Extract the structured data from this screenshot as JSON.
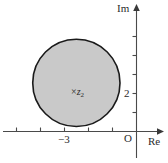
{
  "figure": {
    "kind": "complex-plane-disk-diagram",
    "background_color": "#ffffff"
  },
  "axes": {
    "imaginary_label": "Im",
    "real_label": "Re",
    "origin_label": "O",
    "axis_color": "#4a4a4a"
  },
  "tick_labels": {
    "real": "−3",
    "imaginary": "2"
  },
  "region": {
    "center_label_marker": "×",
    "center_label_symbol": "z",
    "center_label_subscript": "2",
    "fill_color": "#c9c9c9",
    "stroke_color": "#1a1a1a"
  },
  "chart_data": {
    "type": "scatter",
    "title": "",
    "xlabel": "Re",
    "ylabel": "Im",
    "xlim": [
      -6.5,
      1.2
    ],
    "ylim": [
      -0.9,
      5.0
    ],
    "grid": false,
    "legend": null,
    "x_ticks": [
      -5,
      -4,
      -3,
      -2,
      -1,
      0
    ],
    "x_tick_labels": [
      "",
      "",
      "−3",
      "",
      "",
      "O"
    ],
    "y_ticks": [
      1,
      2,
      3,
      4
    ],
    "y_tick_labels": [
      "",
      "2",
      "",
      ""
    ],
    "annotations": [
      {
        "text": "× z₂",
        "x": -3,
        "y": 2,
        "note": "center of shaded disk, marked with a cross"
      }
    ],
    "shapes": [
      {
        "type": "circle",
        "center_x": -3,
        "center_y": 2,
        "radius": 2,
        "filled": true,
        "fill": "#c9c9c9",
        "edge": "#1a1a1a"
      }
    ]
  }
}
